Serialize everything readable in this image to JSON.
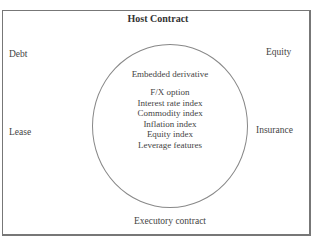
{
  "diagram": {
    "title": "Host Contract",
    "outer_labels": {
      "top_left": "Debt",
      "top_right": "Equity",
      "middle_left": "Lease",
      "middle_right": "Insurance",
      "bottom": "Executory contract"
    },
    "circle": {
      "heading": "Embedded derivative",
      "items": [
        "F/X option",
        "Interest rate index",
        "Commodity index",
        "Inflation index",
        "Equity index",
        "Leverage features"
      ]
    }
  }
}
